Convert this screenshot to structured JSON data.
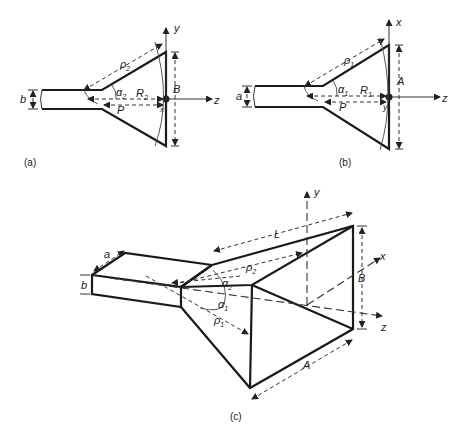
{
  "figure_a": {
    "caption": "(a)",
    "labels": {
      "b": "b",
      "rho": "ρ",
      "rho_sub": "2",
      "alpha": "α",
      "alpha_sub": "2",
      "R": "R",
      "R_sub": "2",
      "P": "P",
      "B": "B",
      "y_axis": "y",
      "z_axis": "z",
      "x_axis": "x"
    }
  },
  "figure_b": {
    "caption": "(b)",
    "labels": {
      "a": "a",
      "rho": "ρ",
      "rho_sub": "1",
      "alpha": "α",
      "alpha_sub": "1",
      "R": "R",
      "R_sub": "1",
      "P": "P",
      "A": "A",
      "x_axis": "x",
      "z_axis": "z",
      "y_axis": "y"
    }
  },
  "figure_c": {
    "caption": "(c)",
    "labels": {
      "a": "a",
      "b": "b",
      "L": "L",
      "rho2": "ρ",
      "rho2_sub": "2",
      "rho1": "ρ",
      "rho1_sub": "1",
      "alpha2": "α",
      "alpha2_sub": "2",
      "alpha1": "α",
      "alpha1_sub": "1",
      "A": "A",
      "B": "B",
      "x_axis": "x",
      "y_axis": "y",
      "z_axis": "z"
    }
  }
}
